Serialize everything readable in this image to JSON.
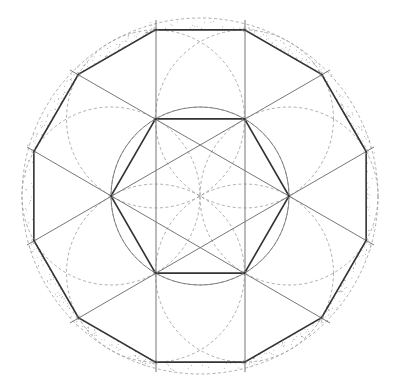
{
  "diagram": {
    "center": [
      200,
      196
    ],
    "dodecagon": {
      "circumradius": 172,
      "start_angle_deg": 15,
      "sides": 12,
      "stroke": "#333333"
    },
    "hexagon": {
      "radius": 89,
      "sides": 6,
      "start_angle_deg": 0,
      "stroke": "#333333"
    },
    "inner_circle": {
      "radius": 89,
      "stroke": "#777777"
    },
    "outer_dashed_circle": {
      "radius": 178,
      "stroke": "#999999"
    },
    "petal_circles": {
      "radius": 89,
      "stroke": "#999999",
      "centers_on": "hexagon vertices and center"
    },
    "construction_lines": {
      "stroke": "#777777",
      "vertical_x": [
        156,
        245
      ],
      "vertical_y_range": [
        20,
        372
      ],
      "diagonals": [
        [
          [
            70,
            70
          ],
          [
            374,
            245
          ]
        ],
        [
          [
            27,
            147
          ],
          [
            330,
            323
          ]
        ],
        [
          [
            70,
            323
          ],
          [
            374,
            147
          ]
        ],
        [
          [
            27,
            245
          ],
          [
            330,
            70
          ]
        ]
      ]
    },
    "stipple_color": "#555555"
  }
}
